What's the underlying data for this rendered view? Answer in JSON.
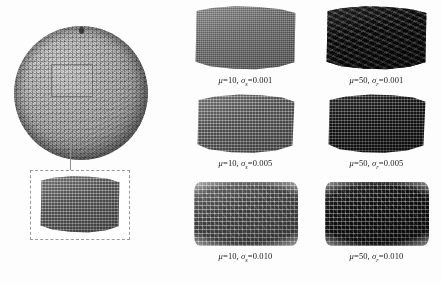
{
  "figure": {
    "type": "scientific-illustration"
  },
  "left_panel": {
    "sphere_label": "tessellated-sphere",
    "roi_label": "region-of-interest",
    "callout_label": "magnified-patch"
  },
  "grid": {
    "columns": [
      {
        "mu": "10"
      },
      {
        "mu": "50"
      }
    ],
    "cells": [
      {
        "mu_symbol": "μ",
        "mu_value": "10",
        "sigma_symbol": "σ",
        "sigma_sub": "s",
        "sigma_value": "0.001",
        "tone": "mu10",
        "texture": "fine",
        "edge": "clean"
      },
      {
        "mu_symbol": "μ",
        "mu_value": "50",
        "sigma_symbol": "σ",
        "sigma_sub": "r",
        "sigma_value": "0.001",
        "tone": "mu50",
        "texture": "wavy",
        "edge": "clean"
      },
      {
        "mu_symbol": "μ",
        "mu_value": "10",
        "sigma_symbol": "σ",
        "sigma_sub": "s",
        "sigma_value": "0.005",
        "tone": "mu10",
        "texture": "mesh",
        "edge": "ragged-mid"
      },
      {
        "mu_symbol": "μ",
        "mu_value": "50",
        "sigma_symbol": "σ",
        "sigma_sub": "r",
        "sigma_value": "0.005",
        "tone": "mu50",
        "texture": "mesh",
        "edge": "ragged-mid"
      },
      {
        "mu_symbol": "μ",
        "mu_value": "10",
        "sigma_symbol": "σ",
        "sigma_sub": "s",
        "sigma_value": "0.010",
        "tone": "mu10",
        "texture": "coarse",
        "edge": "ragged-high"
      },
      {
        "mu_symbol": "μ",
        "mu_value": "50",
        "sigma_symbol": "σ",
        "sigma_sub": "r",
        "sigma_value": "0.010",
        "tone": "mu50",
        "texture": "coarse",
        "edge": "ragged-high"
      }
    ]
  },
  "colors": {
    "patch_mu10": "#6f6f6f",
    "patch_mu50": "#1b1b1b",
    "sphere_mid": "#9a9a9a",
    "callout_border": "#9a9a9a",
    "leader_line": "#8d8d8d",
    "text": "#1a1a1a",
    "background": "#fdfdfd"
  }
}
